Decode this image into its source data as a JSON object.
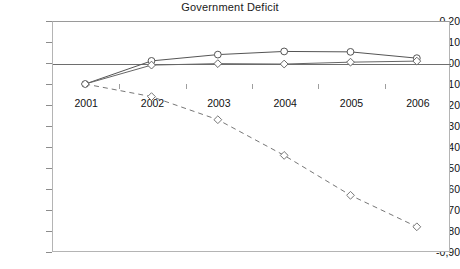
{
  "chart_data": {
    "type": "line",
    "title": "Government Deficit",
    "xlabel": "",
    "ylabel": "",
    "categories": [
      "2001",
      "2002",
      "2003",
      "2004",
      "2005",
      "2006"
    ],
    "ylim": [
      -0.9,
      0.2
    ],
    "y_ticks": [
      0.2,
      0.1,
      0.0,
      -0.1,
      -0.2,
      -0.3,
      -0.4,
      -0.5,
      -0.6,
      -0.7,
      -0.8,
      -0.9
    ],
    "y_tick_labels": [
      "0,20",
      "0,10",
      "0,00",
      "-0,10",
      "-0,20",
      "-0,30",
      "-0,40",
      "-0,50",
      "-0,60",
      "-0,70",
      "-0,80",
      "-0,90"
    ],
    "grid": false,
    "legend": "none",
    "decimal_separator": ",",
    "zero_line": 0.0,
    "series": [
      {
        "name": "series-upper-solid",
        "style": "solid",
        "marker": "circle",
        "color": "#555555",
        "values": [
          -0.1,
          0.01,
          0.04,
          0.055,
          0.053,
          0.023
        ]
      },
      {
        "name": "series-lower-solid",
        "style": "solid",
        "marker": "diamond",
        "color": "#666666",
        "values": [
          -0.1,
          -0.01,
          -0.003,
          -0.005,
          0.004,
          0.009
        ]
      },
      {
        "name": "series-dashed",
        "style": "dashed",
        "marker": "diamond",
        "color": "#777777",
        "values": [
          -0.1,
          -0.16,
          -0.27,
          -0.44,
          -0.63,
          -0.78
        ]
      }
    ]
  }
}
